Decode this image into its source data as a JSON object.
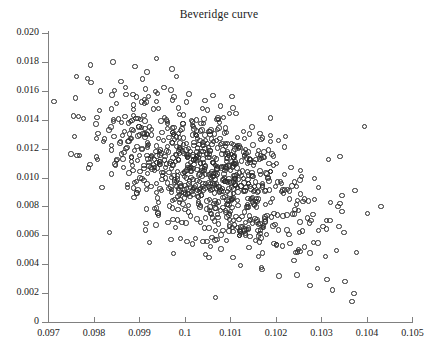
{
  "chart_data": {
    "type": "scatter",
    "title": "Beveridge curve",
    "xlabel": "",
    "ylabel": "",
    "xlim": [
      0.097,
      0.105
    ],
    "ylim": [
      0.0,
      0.02
    ],
    "grid": false,
    "legend": null,
    "marker": "open-circle",
    "marker_color": "#2b2b2b",
    "n_points": 900,
    "relationship": "negative correlation between unemployment rate (x) and vacancy rate (y)",
    "xticks": [
      0.097,
      0.098,
      0.099,
      0.1,
      0.101,
      0.102,
      0.103,
      0.104,
      0.105
    ],
    "xtick_labels": [
      "0.097",
      "0.098",
      "0.099",
      "0.1",
      "0.101",
      "0.102",
      "0.103",
      "0.104",
      "0.105"
    ],
    "yticks": [
      0.0,
      0.002,
      0.004,
      0.006,
      0.008,
      0.01,
      0.012,
      0.014,
      0.016,
      0.018,
      0.02
    ],
    "ytick_labels": [
      "0",
      "0.002",
      "0.004",
      "0.006",
      "0.008",
      "0.010",
      "0.012",
      "0.014",
      "0.016",
      "0.018",
      "0.020"
    ],
    "cloud": {
      "x_mean": 0.10055,
      "y_mean": 0.01005,
      "x_sd": 0.00115,
      "y_sd": 0.0027,
      "correlation": -0.52
    },
    "notable_points": [
      {
        "x": 0.09713,
        "y": 0.01528,
        "note": "leftmost point"
      },
      {
        "x": 0.09843,
        "y": 0.018,
        "note": "high left point"
      },
      {
        "x": 0.09938,
        "y": 0.01823,
        "note": "topmost point"
      },
      {
        "x": 0.10068,
        "y": 0.00168,
        "note": "lowest point"
      },
      {
        "x": 0.10432,
        "y": 0.008,
        "note": "rightmost point"
      },
      {
        "x": 0.10395,
        "y": 0.01352,
        "note": "high right point"
      }
    ]
  }
}
